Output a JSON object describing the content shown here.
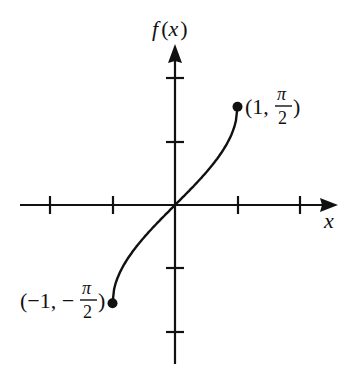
{
  "chart_data": {
    "type": "line",
    "title": "",
    "function": "f(x) = arcsin(x)",
    "xlabel": "x",
    "ylabel": "f(x)",
    "xlim": [
      -2.5,
      2.6
    ],
    "ylim": [
      -2.5,
      2.6
    ],
    "x_ticks": [
      -2,
      -1,
      1,
      2
    ],
    "y_ticks": [
      -2,
      -1,
      1,
      2
    ],
    "tick_labels_shown": false,
    "grid": false,
    "legend": null,
    "series": [
      {
        "name": "f(x)",
        "x": [
          -1,
          -0.9,
          -0.75,
          -0.5,
          -0.25,
          0,
          0.25,
          0.5,
          0.75,
          0.9,
          1
        ],
        "values": [
          -1.5708,
          -1.1198,
          -0.8481,
          -0.5236,
          -0.2527,
          0,
          0.2527,
          0.5236,
          0.8481,
          1.1198,
          1.5708
        ]
      }
    ],
    "endpoints": [
      {
        "x": -1,
        "y": -1.5708,
        "label": "(−1, −π/2)",
        "closed": true
      },
      {
        "x": 1,
        "y": 1.5708,
        "label": "(1, π/2)",
        "closed": true
      }
    ]
  },
  "labels": {
    "y_axis": {
      "f": "f",
      "open": "(",
      "x": "x",
      "close": ")"
    },
    "x_axis": "x",
    "top_point": {
      "prefix": "(1,",
      "num": "π",
      "den": "2",
      "suffix": ")"
    },
    "bottom_point": {
      "prefix": "(−1, −",
      "num": "π",
      "den": "2",
      "suffix": ")"
    }
  },
  "colors": {
    "ink": "#111111",
    "background": "#ffffff"
  }
}
